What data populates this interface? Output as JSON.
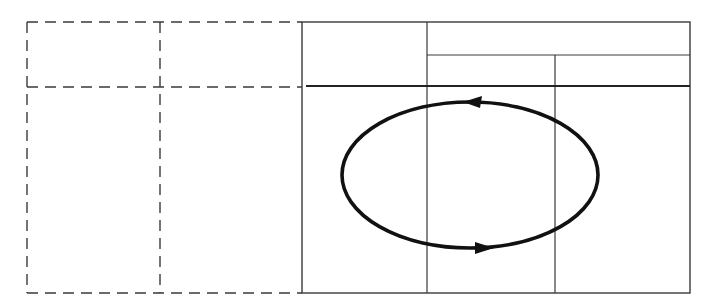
{
  "diagram": {
    "title": "",
    "width": 716,
    "height": 305,
    "colors": {
      "background": "#ffffff",
      "dashed_line": "#3a3a3a",
      "table_line": "#3a3a3a",
      "cycle_line": "#111111"
    },
    "dashed_region": {
      "x": 27,
      "y": 22,
      "right": 302,
      "bottom": 293,
      "vertical_divider_x": 160,
      "horizontal_divider_y": 87
    },
    "table": {
      "x": 302,
      "y": 22,
      "right": 690,
      "bottom": 293,
      "column_divider_1_x": 427,
      "column_divider_2_x": 555,
      "subheader_line_y": 55,
      "header_rule_y": 86
    },
    "cycle": {
      "shape": "ellipse",
      "cx": 470,
      "cy": 175,
      "rx": 128,
      "ry": 73,
      "direction": "counterclockwise",
      "arrows": [
        {
          "name": "top-arrow",
          "x": 475,
          "y": 102,
          "points": "left"
        },
        {
          "name": "bottom-arrow",
          "x": 484,
          "y": 248,
          "points": "right"
        }
      ]
    },
    "labels": []
  }
}
